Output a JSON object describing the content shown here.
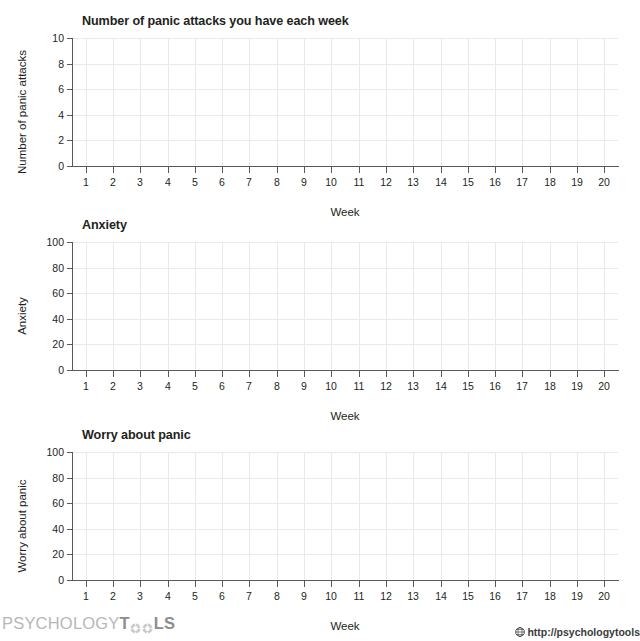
{
  "document": {
    "type": "worksheet",
    "background": "#ffffff",
    "axis_color": "#58595b",
    "grid_color": "#e9e9e9",
    "text_color": "#231f20"
  },
  "charts": [
    {
      "title": "Number of panic attacks you have each week",
      "ylabel": "Number of panic attacks",
      "xlabel": "Week",
      "yticks": [
        "0",
        "2",
        "4",
        "6",
        "8",
        "10"
      ],
      "xticks": [
        "1",
        "2",
        "3",
        "4",
        "5",
        "6",
        "7",
        "8",
        "9",
        "10",
        "11",
        "12",
        "13",
        "14",
        "15",
        "16",
        "17",
        "18",
        "19",
        "20"
      ]
    },
    {
      "title": "Anxiety",
      "ylabel": "Anxiety",
      "xlabel": "Week",
      "yticks": [
        "0",
        "20",
        "40",
        "60",
        "80",
        "100"
      ],
      "xticks": [
        "1",
        "2",
        "3",
        "4",
        "5",
        "6",
        "7",
        "8",
        "9",
        "10",
        "11",
        "12",
        "13",
        "14",
        "15",
        "16",
        "17",
        "18",
        "19",
        "20"
      ]
    },
    {
      "title": "Worry about panic",
      "ylabel": "Worry about panic",
      "xlabel": "Week",
      "yticks": [
        "0",
        "20",
        "40",
        "60",
        "80",
        "100"
      ],
      "xticks": [
        "1",
        "2",
        "3",
        "4",
        "5",
        "6",
        "7",
        "8",
        "9",
        "10",
        "11",
        "12",
        "13",
        "14",
        "15",
        "16",
        "17",
        "18",
        "19",
        "20"
      ]
    }
  ],
  "chart_data": [
    {
      "type": "line",
      "title": "Number of panic attacks you have each week",
      "xlabel": "Week",
      "ylabel": "Number of panic attacks",
      "x": [
        1,
        2,
        3,
        4,
        5,
        6,
        7,
        8,
        9,
        10,
        11,
        12,
        13,
        14,
        15,
        16,
        17,
        18,
        19,
        20
      ],
      "xticklabels": [
        "1",
        "2",
        "3",
        "4",
        "5",
        "6",
        "7",
        "8",
        "9",
        "10",
        "11",
        "12",
        "13",
        "14",
        "15",
        "16",
        "17",
        "18",
        "19",
        "20"
      ],
      "yticks": [
        0,
        2,
        4,
        6,
        8,
        10
      ],
      "ylim": [
        0,
        10
      ],
      "xlim": [
        0.5,
        20.5
      ],
      "series": [
        {
          "name": "Panic attacks",
          "values": []
        }
      ],
      "grid": true,
      "legend": "none",
      "note": "Blank tracking grid - no data plotted"
    },
    {
      "type": "line",
      "title": "Anxiety",
      "xlabel": "Week",
      "ylabel": "Anxiety",
      "x": [
        1,
        2,
        3,
        4,
        5,
        6,
        7,
        8,
        9,
        10,
        11,
        12,
        13,
        14,
        15,
        16,
        17,
        18,
        19,
        20
      ],
      "xticklabels": [
        "1",
        "2",
        "3",
        "4",
        "5",
        "6",
        "7",
        "8",
        "9",
        "10",
        "11",
        "12",
        "13",
        "14",
        "15",
        "16",
        "17",
        "18",
        "19",
        "20"
      ],
      "yticks": [
        0,
        20,
        40,
        60,
        80,
        100
      ],
      "ylim": [
        0,
        100
      ],
      "xlim": [
        0.5,
        20.5
      ],
      "series": [
        {
          "name": "Anxiety",
          "values": []
        }
      ],
      "grid": true,
      "legend": "none",
      "note": "Blank tracking grid - no data plotted"
    },
    {
      "type": "line",
      "title": "Worry about panic",
      "xlabel": "Week",
      "ylabel": "Worry about panic",
      "x": [
        1,
        2,
        3,
        4,
        5,
        6,
        7,
        8,
        9,
        10,
        11,
        12,
        13,
        14,
        15,
        16,
        17,
        18,
        19,
        20
      ],
      "xticklabels": [
        "1",
        "2",
        "3",
        "4",
        "5",
        "6",
        "7",
        "8",
        "9",
        "10",
        "11",
        "12",
        "13",
        "14",
        "15",
        "16",
        "17",
        "18",
        "19",
        "20"
      ],
      "yticks": [
        0,
        20,
        40,
        60,
        80,
        100
      ],
      "ylim": [
        0,
        100
      ],
      "xlim": [
        0.5,
        20.5
      ],
      "series": [
        {
          "name": "Worry about panic",
          "values": []
        }
      ],
      "grid": true,
      "legend": "none",
      "note": "Blank tracking grid - no data plotted"
    }
  ],
  "footer": {
    "logo_part1": "PSYCHOLOGY",
    "logo_part2": "T",
    "logo_part3": "LS",
    "url": "http://psychologytools"
  }
}
